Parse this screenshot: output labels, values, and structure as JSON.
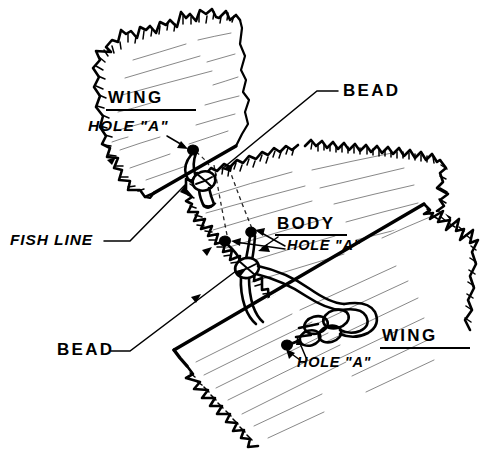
{
  "figure": {
    "background_color": "#ffffff",
    "ink_color": "#000000",
    "width": 481,
    "height": 460,
    "style": "black-and-white technical line drawing"
  },
  "labels": {
    "wing_top": {
      "text": "WING",
      "style": "upright-underlined",
      "x": 108,
      "y": 103
    },
    "hole_a_top": {
      "text": "HOLE \"A\"",
      "style": "italic",
      "x": 88,
      "y": 131
    },
    "bead_top": {
      "text": "BEAD",
      "style": "upright",
      "x": 343,
      "y": 96
    },
    "fish_line": {
      "text": "FISH LINE",
      "style": "italic",
      "x": 10,
      "y": 245
    },
    "body": {
      "text": "BODY",
      "style": "upright-underlined",
      "x": 277,
      "y": 229
    },
    "hole_a_body": {
      "text": "HOLE \"A\"",
      "style": "italic",
      "x": 287,
      "y": 250
    },
    "bead_bottom": {
      "text": "BEAD",
      "style": "upright",
      "x": 57,
      "y": 355
    },
    "wing_bottom": {
      "text": "WING",
      "style": "upright-underlined",
      "x": 382,
      "y": 341
    },
    "hole_a_bottom": {
      "text": "HOLE \"A\"",
      "style": "italic",
      "x": 297,
      "y": 367
    }
  },
  "parts": {
    "upper_wing": "upper wing panel, torn ragged top and left edges",
    "body": "fuselage body panel, torn left edge",
    "lower_wing": "lower wing panel, torn right and bottom edges",
    "cords": "fish line running through hole A of each panel",
    "beads": "beads threaded on the fish line at each joint"
  }
}
